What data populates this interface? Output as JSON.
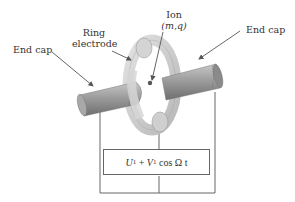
{
  "labels": {
    "end_cap_left": "End cap",
    "ring_line1": "Ring",
    "ring_line2": "electrode",
    "ion_line1": "Ion",
    "ion_line2": "(m,q)",
    "end_cap_right": "End cap"
  },
  "power_supply": {
    "u": "U",
    "u_sub": "1",
    "plus": " + ",
    "v": "V",
    "v_sub": "1",
    "rest": " cos Ω t"
  },
  "colors": {
    "rod": "#9a9a9a",
    "ring": "#cfcfcf",
    "wire": "#666666",
    "text": "#333333"
  }
}
